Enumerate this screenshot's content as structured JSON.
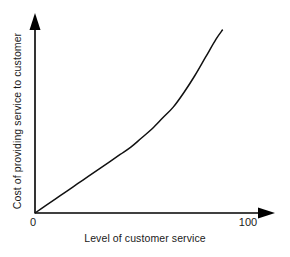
{
  "chart_data": {
    "type": "line",
    "title": "",
    "xlabel": "Level of customer service",
    "ylabel": "Cost of providing service to customer",
    "xlim": [
      0,
      118
    ],
    "ylim": [
      0,
      100
    ],
    "xticks": [
      "0",
      "100"
    ],
    "xtick_values": [
      0,
      100
    ],
    "yticks": [],
    "grid": false,
    "legend": false,
    "legend_position": "none",
    "series": [
      {
        "name": "Cost curve",
        "color": "#111111",
        "x": [
          0,
          5,
          10,
          15,
          20,
          25,
          30,
          35,
          40,
          45,
          50,
          55,
          60,
          65,
          70,
          75,
          80,
          85,
          88
        ],
        "y": [
          0,
          4,
          8,
          12,
          16,
          20,
          24,
          28,
          32,
          36,
          41,
          46,
          52,
          58,
          66,
          75,
          85,
          95,
          100
        ]
      }
    ],
    "annotations": []
  },
  "axes": {
    "x_tick_zero": "0",
    "x_tick_hundred": "100",
    "x_title": "Level of customer service",
    "y_title": "Cost of providing service to customer"
  },
  "colors": {
    "background": "#ffffff",
    "axis": "#000000",
    "curve": "#111111",
    "text": "#1a1a1a"
  }
}
